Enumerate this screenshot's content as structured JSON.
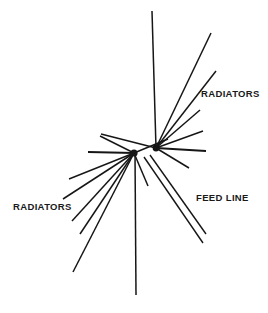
{
  "figure": {
    "kind": "antenna-schematic",
    "background_color": "#ffffff",
    "ink_color": "#161616",
    "width": 268,
    "height": 313
  },
  "labels": [
    {
      "id": "radiators-right",
      "text": "RADIATORS",
      "x": 201,
      "y": 89
    },
    {
      "id": "radiators-left",
      "text": "RADIATORS",
      "x": 13,
      "y": 202
    },
    {
      "id": "feed-line",
      "text": "FEED LINE",
      "x": 196,
      "y": 193
    }
  ],
  "hubs": [
    {
      "id": "left-hub",
      "x": 134,
      "y": 153,
      "r": 3.6
    },
    {
      "id": "right-hub",
      "x": 156,
      "y": 148,
      "r": 3.4
    }
  ],
  "chart_data": {
    "type": "line",
    "title": "",
    "xlabel": "",
    "ylabel": "",
    "grid": false,
    "legend": "none",
    "xlim": [
      0,
      268
    ],
    "ylim": [
      0,
      313
    ],
    "note": "Radial wire segments of a multi-band fan dipole antenna; all coordinates in image pixels, y increases downward.",
    "series": [
      {
        "name": "right-hub-radiators",
        "hub": [
          156,
          148
        ],
        "segments": [
          {
            "id": "rh-vertical-up",
            "x1": 156,
            "y1": 148,
            "x2": 152,
            "y2": 11,
            "width": 1.5
          },
          {
            "id": "rh-up-right-1",
            "x1": 156,
            "y1": 148,
            "x2": 211,
            "y2": 33,
            "width": 1.5
          },
          {
            "id": "rh-up-right-2",
            "x1": 156,
            "y1": 148,
            "x2": 216,
            "y2": 71,
            "width": 1.5
          },
          {
            "id": "rh-up-right-3",
            "x1": 156,
            "y1": 148,
            "x2": 200,
            "y2": 110,
            "width": 1.5
          },
          {
            "id": "rh-up-right-4",
            "x1": 156,
            "y1": 148,
            "x2": 203,
            "y2": 131,
            "width": 1.5
          },
          {
            "id": "rh-horizontal",
            "x1": 156,
            "y1": 148,
            "x2": 206,
            "y2": 151,
            "width": 2.0
          },
          {
            "id": "rh-down-right",
            "x1": 156,
            "y1": 148,
            "x2": 189,
            "y2": 168,
            "width": 1.5
          },
          {
            "id": "rh-to-left-hub",
            "x1": 156,
            "y1": 148,
            "x2": 101,
            "y2": 134,
            "width": 1.5
          }
        ]
      },
      {
        "name": "left-hub-radiators",
        "hub": [
          134,
          153
        ],
        "segments": [
          {
            "id": "lh-up-right",
            "x1": 134,
            "y1": 153,
            "x2": 168,
            "y2": 139,
            "width": 1.5
          },
          {
            "id": "lh-horizontal",
            "x1": 134,
            "y1": 153,
            "x2": 88,
            "y2": 152,
            "width": 2.0
          },
          {
            "id": "lh-up-left",
            "x1": 134,
            "y1": 153,
            "x2": 100,
            "y2": 136,
            "width": 1.5
          },
          {
            "id": "lh-down-left-1",
            "x1": 134,
            "y1": 153,
            "x2": 69,
            "y2": 179,
            "width": 1.5
          },
          {
            "id": "lh-down-left-2",
            "x1": 134,
            "y1": 153,
            "x2": 63,
            "y2": 199,
            "width": 1.5
          },
          {
            "id": "lh-down-left-3",
            "x1": 134,
            "y1": 153,
            "x2": 72,
            "y2": 221,
            "width": 1.5
          },
          {
            "id": "lh-down-left-4",
            "x1": 134,
            "y1": 153,
            "x2": 80,
            "y2": 234,
            "width": 1.5
          },
          {
            "id": "lh-down-left-5",
            "x1": 134,
            "y1": 153,
            "x2": 73,
            "y2": 272,
            "width": 1.5
          },
          {
            "id": "lh-vertical-down",
            "x1": 135,
            "y1": 153,
            "x2": 136,
            "y2": 295,
            "width": 1.5
          },
          {
            "id": "lh-down-right",
            "x1": 134,
            "y1": 153,
            "x2": 148,
            "y2": 186,
            "width": 1.5
          }
        ]
      },
      {
        "name": "feed-line",
        "hub": [
          156,
          148
        ],
        "segments": [
          {
            "id": "feed-wire-a",
            "x1": 150,
            "y1": 155,
            "x2": 206,
            "y2": 234,
            "width": 1.4
          },
          {
            "id": "feed-wire-b",
            "x1": 144,
            "y1": 157,
            "x2": 203,
            "y2": 243,
            "width": 1.4
          }
        ]
      }
    ]
  }
}
